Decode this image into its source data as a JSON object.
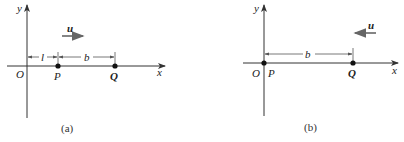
{
  "panels": [
    {
      "id": "a",
      "caption": "(a)",
      "axes": {
        "x_label": "x",
        "y_label": "y",
        "origin_label": "O"
      },
      "points": [
        {
          "label": "P"
        },
        {
          "label": "Q"
        }
      ],
      "dimensions": [
        {
          "label": "l",
          "from": "O",
          "to": "P"
        },
        {
          "label": "b",
          "from": "P",
          "to": "Q"
        }
      ],
      "velocity": {
        "label": "u",
        "direction": "right"
      }
    },
    {
      "id": "b",
      "caption": "(b)",
      "axes": {
        "x_label": "x",
        "y_label": "y",
        "origin_label": "O"
      },
      "points": [
        {
          "label": "P"
        },
        {
          "label": "Q"
        }
      ],
      "dimensions": [
        {
          "label": "b",
          "from": "P",
          "to": "Q"
        }
      ],
      "velocity": {
        "label": "u",
        "direction": "left"
      }
    }
  ],
  "colors": {
    "ink": "#222222",
    "arrow": "#666666",
    "dimension": "#555555"
  }
}
